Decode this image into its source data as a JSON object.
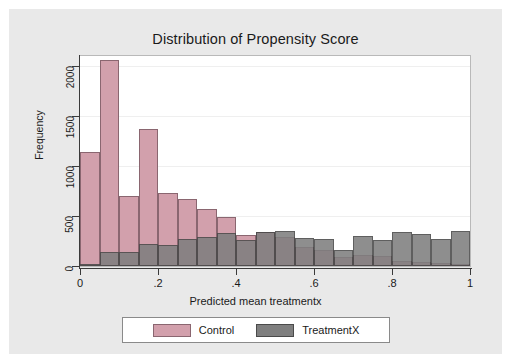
{
  "chart_data": {
    "type": "bar",
    "title": "Distribution of Propensity Score",
    "xlabel": "Predicted mean treatmentx",
    "ylabel": "Frequency",
    "xlim": [
      0,
      1
    ],
    "ylim": [
      0,
      2100
    ],
    "grid": true,
    "grid_axis": "y",
    "legend_position": "bottom",
    "bin_width": 0.05,
    "overlap": "overlaid",
    "x_ticks": [
      "0",
      ".2",
      ".4",
      ".6",
      ".8",
      "1"
    ],
    "x_tick_values": [
      0,
      0.2,
      0.4,
      0.6,
      0.8,
      1
    ],
    "y_ticks": [
      "0",
      "500",
      "1000",
      "1500",
      "2000"
    ],
    "y_tick_values": [
      0,
      500,
      1000,
      1500,
      2000
    ],
    "bin_starts": [
      0,
      0.05,
      0.1,
      0.15,
      0.2,
      0.25,
      0.3,
      0.35,
      0.4,
      0.45,
      0.5,
      0.55,
      0.6,
      0.65,
      0.7,
      0.75,
      0.8,
      0.85,
      0.9,
      0.95
    ],
    "series": [
      {
        "name": "Control",
        "color": "#d2a0ac",
        "edge_color": "#8a6670",
        "values": [
          1140,
          2060,
          705,
          1370,
          730,
          675,
          575,
          490,
          310,
          345,
          290,
          195,
          165,
          95,
          115,
          105,
          55,
          40,
          35,
          15
        ]
      },
      {
        "name": "TreatmentX",
        "color": "#7f7f7f",
        "edge_color": "#4a4a4a",
        "values": [
          10,
          145,
          145,
          220,
          210,
          275,
          295,
          330,
          260,
          340,
          350,
          285,
          275,
          165,
          305,
          265,
          340,
          325,
          275,
          350
        ]
      }
    ]
  },
  "legend": {
    "items": [
      {
        "label": "Control",
        "swatch": "pink-swatch"
      },
      {
        "label": "TreatmentX",
        "swatch": "gray-swatch"
      }
    ]
  },
  "colors": {
    "control": "#d2a0ac",
    "treatment": "#7f7f7f",
    "figure_background": "#e9e9e9",
    "plot_background": "#ffffff",
    "axis": "#3a3a3a"
  }
}
